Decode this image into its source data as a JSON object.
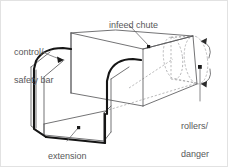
{
  "figure": {
    "kind": "technical-line-diagram",
    "width": 228,
    "height": 167,
    "background_color": "#ffffff",
    "line_color": "#5a5a5c",
    "bar_color": "#1a1a1a",
    "dashed_color": "#a8a8aa",
    "text_color": "#58585a",
    "border_color": "#e2e2e2"
  },
  "labels": {
    "infeed_chute": "infeed chute",
    "control_safety_bar_line1": "control/",
    "control_safety_bar_line2": "safety bar",
    "rollers_danger_zone_line1": "rollers/",
    "rollers_danger_zone_line2": "danger",
    "rollers_danger_zone_line3": "zone",
    "extension": "extension"
  },
  "callouts": [
    {
      "name": "infeed-chute",
      "target": "top face of chute",
      "marker": "dot"
    },
    {
      "name": "control-safety-bar",
      "target": "thick bar on left rim",
      "marker": "arrowhead"
    },
    {
      "name": "rollers-danger-zone",
      "target": "dashed cylinder at far end",
      "marker": "dot"
    },
    {
      "name": "extension",
      "target": "floor of extension trough",
      "marker": "dot"
    }
  ],
  "rotation_arrows": [
    {
      "name": "roller-rotation-arrow-top",
      "direction": "counter-clockwise"
    },
    {
      "name": "roller-rotation-arrow-bottom",
      "direction": "counter-clockwise"
    }
  ]
}
